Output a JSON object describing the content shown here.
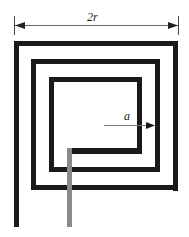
{
  "diagram": {
    "labels": {
      "width_dimension": "2r",
      "inner_dimension": "a"
    },
    "colors": {
      "conductor": "#1a1a1a",
      "lead": "#8a8a8a",
      "dimension_line": "#555555",
      "background": "#ffffff"
    },
    "turns": 3
  }
}
